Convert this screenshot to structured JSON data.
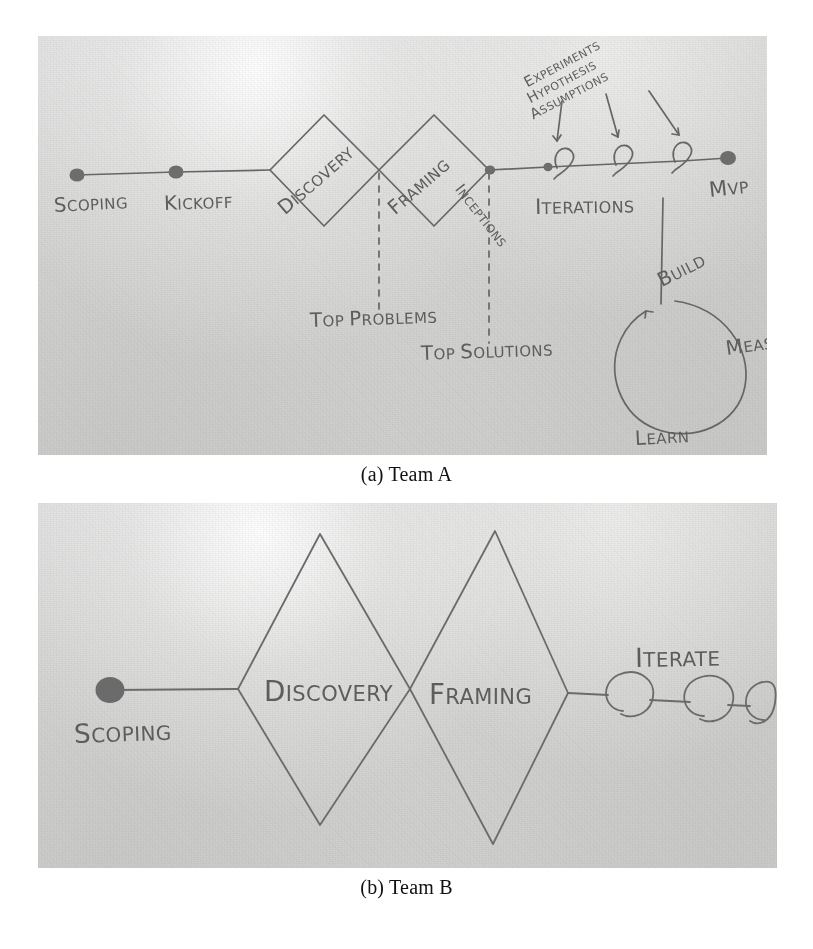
{
  "figures": [
    {
      "id": "team-a",
      "caption": "(a) Team A",
      "diagram_type": "hand-drawn-double-diamond-timeline",
      "nodes": [
        {
          "label": "Scoping",
          "type": "milestone-dot"
        },
        {
          "label": "Kickoff",
          "type": "milestone-dot"
        },
        {
          "label": "Discovery",
          "type": "diamond"
        },
        {
          "label": "Framing",
          "type": "diamond"
        },
        {
          "label": "Inceptions",
          "type": "milestone-dot"
        },
        {
          "label": "Iterations",
          "type": "loop-sequence"
        },
        {
          "label": "MVP",
          "type": "milestone-dot"
        }
      ],
      "dashed_callouts": [
        {
          "label": "Top Problems",
          "from": "Discovery"
        },
        {
          "label": "Top Solutions",
          "from": "Framing"
        }
      ],
      "arrow_callouts": [
        {
          "label": "Experiments"
        },
        {
          "label": "Hypothesis"
        },
        {
          "label": "Assumptions"
        }
      ],
      "loop": {
        "name": "build-measure-learn",
        "steps": [
          "Build",
          "Measure",
          "Learn"
        ]
      }
    },
    {
      "id": "team-b",
      "caption": "(b) Team B",
      "diagram_type": "hand-drawn-double-diamond-timeline",
      "nodes": [
        {
          "label": "Scoping",
          "type": "milestone-dot"
        },
        {
          "label": "Discovery",
          "type": "diamond"
        },
        {
          "label": "Framing",
          "type": "diamond"
        },
        {
          "label": "Iterate",
          "type": "loop-sequence"
        }
      ],
      "dashed_callouts": [],
      "arrow_callouts": [],
      "loop": null
    }
  ],
  "colors": {
    "paper": "#d6d6d4",
    "graphite": "#5d5d5d",
    "graphite_dark": "#6a6a6a",
    "caption_text": "#111111",
    "page_background": "#ffffff"
  }
}
